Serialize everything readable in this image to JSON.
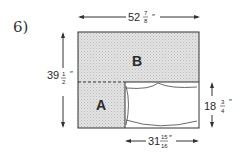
{
  "problem": {
    "number_label": "6)"
  },
  "regions": {
    "a_label": "A",
    "b_label": "B"
  },
  "dimensions": {
    "top_width": {
      "whole": "52",
      "num": "7",
      "den": "8",
      "unit": "″"
    },
    "left_height": {
      "whole": "39",
      "num": "1",
      "den": "2",
      "unit": "″"
    },
    "right_height": {
      "whole": "18",
      "num": "3",
      "den": "4",
      "unit": "″"
    },
    "bottom_width": {
      "whole": "31",
      "num": "15",
      "den": "16",
      "unit": "″"
    }
  },
  "colors": {
    "shade": "#d9d9d9",
    "stroke": "#333333"
  }
}
